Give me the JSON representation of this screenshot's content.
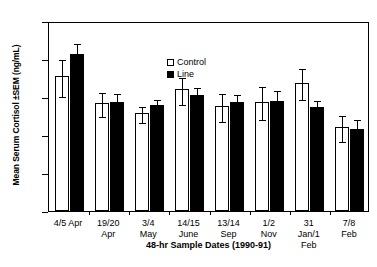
{
  "chart_data": {
    "type": "bar",
    "title": "",
    "xlabel": "48-hr Sample Dates (1990-91)",
    "ylabel": "Mean Serum Cortisol ±SEM (ng/mL)",
    "ylim": [
      0,
      25
    ],
    "yticks": [
      0,
      5,
      10,
      15,
      20,
      25
    ],
    "ytick_labels": [
      "0",
      "5",
      "10",
      "15",
      "20",
      "25"
    ],
    "grid": false,
    "legend_position": "top-center",
    "categories": [
      "4/5 Apr",
      "19/20 Apr",
      "3/4 May",
      "14/15 June",
      "13/14 Sep",
      "1/2 Nov",
      "31 Jan/1 Feb",
      "7/8 Feb"
    ],
    "category_lines": [
      [
        "4/5 Apr"
      ],
      [
        "19/20",
        "Apr"
      ],
      [
        "3/4",
        "May"
      ],
      [
        "14/15",
        "June"
      ],
      [
        "13/14",
        "Sep"
      ],
      [
        "1/2",
        "Nov"
      ],
      [
        "31",
        "Jan/1",
        "Feb"
      ],
      [
        "7/8",
        "Feb"
      ]
    ],
    "series": [
      {
        "name": "Control",
        "color": "#ffffff",
        "edge_color": "#000000",
        "values": [
          17.7,
          14.2,
          12.9,
          16.0,
          13.8,
          14.4,
          16.9,
          11.0
        ],
        "errors": [
          2.4,
          1.6,
          1.0,
          1.8,
          1.8,
          2.2,
          2.0,
          1.7
        ]
      },
      {
        "name": "Line",
        "color": "#000000",
        "edge_color": "#000000",
        "values": [
          20.6,
          14.4,
          13.9,
          15.3,
          14.4,
          14.5,
          13.7,
          10.8
        ],
        "errors": [
          1.7,
          1.3,
          1.0,
          1.2,
          1.1,
          1.5,
          1.1,
          1.4
        ]
      }
    ]
  },
  "legend": {
    "items": [
      {
        "label": "Control",
        "swatch": "open-square"
      },
      {
        "label": "Line",
        "swatch": "filled-square"
      }
    ]
  }
}
